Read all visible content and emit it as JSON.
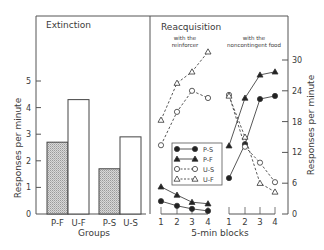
{
  "chart_data": [
    {
      "type": "bar",
      "title": "Extinction",
      "xlabel": "Groups",
      "ylabel": "Responses per minute",
      "ylim": [
        0,
        6
      ],
      "yticks": [
        0,
        1,
        2,
        3,
        4,
        5
      ],
      "categories": [
        "P-F",
        "U-F",
        "P-S",
        "U-S"
      ],
      "values": [
        2.7,
        4.3,
        1.7,
        2.9
      ],
      "bar_fill": [
        "hatched",
        "white",
        "hatched",
        "white"
      ]
    },
    {
      "type": "line",
      "title": "Reacquisition",
      "subtitles": [
        "with the reinforcer",
        "with the noncontingent food"
      ],
      "xlabel": "5-min blocks",
      "ylabel": "Responses per minute",
      "ylim": [
        0,
        30
      ],
      "yticks": [
        0,
        6,
        12,
        18,
        24,
        30
      ],
      "x": [
        1,
        2,
        3,
        4
      ],
      "legend": [
        "P-S",
        "P-F",
        "U-S",
        "U-F"
      ],
      "panels": [
        {
          "name": "with the reinforcer",
          "series": [
            {
              "name": "P-S",
              "values": [
                2.5,
                1.6,
                1.0,
                0.6
              ]
            },
            {
              "name": "P-F",
              "values": [
                5.3,
                3.7,
                2.3,
                2.0
              ]
            },
            {
              "name": "U-S",
              "values": [
                13.4,
                19.9,
                24.0,
                22.6
              ]
            },
            {
              "name": "U-F",
              "values": [
                18.3,
                25.5,
                27.7,
                31.6
              ]
            }
          ]
        },
        {
          "name": "with the noncontingent food",
          "series": [
            {
              "name": "P-S",
              "values": [
                7.0,
                13.6,
                22.4,
                23.0
              ]
            },
            {
              "name": "P-F",
              "values": [
                13.3,
                22.6,
                27.1,
                27.7
              ]
            },
            {
              "name": "U-S",
              "values": [
                23.2,
                13.1,
                10.0,
                6.2
              ]
            },
            {
              "name": "U-F",
              "values": [
                23.0,
                15.0,
                6.0,
                4.3
              ]
            }
          ]
        }
      ]
    }
  ],
  "labels": {
    "extinction": "Extinction",
    "reacquisition": "Reacquisition",
    "with_the_1": "with the",
    "reinforcer": "reinforcer",
    "with_the_2": "with the",
    "noncontingent": "noncontingent food",
    "groups": "Groups",
    "blocks": "5-min  blocks",
    "ylabel": "Responses per minute",
    "bar_cats": [
      "P-F",
      "U-F",
      "P-S",
      "U-S"
    ],
    "left_ticks": [
      "0",
      "1",
      "2",
      "3",
      "4",
      "5"
    ],
    "right_ticks": [
      "0",
      "6",
      "12",
      "18",
      "24",
      "30"
    ],
    "x_ticks": [
      "1",
      "2",
      "3",
      "4"
    ],
    "legend": [
      "P-S",
      "P-F",
      "U-S",
      "U-F"
    ]
  }
}
